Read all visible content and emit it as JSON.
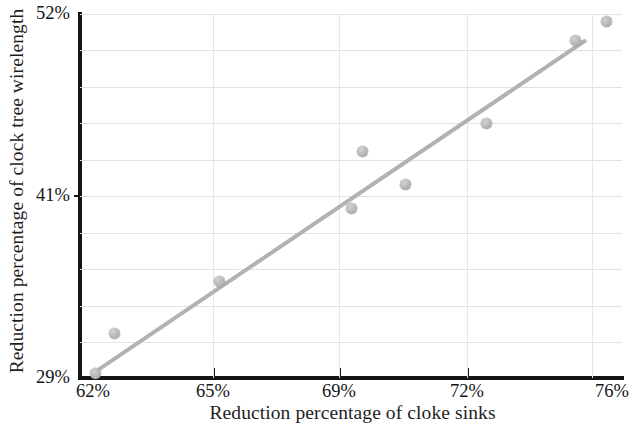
{
  "chart_data": {
    "type": "scatter",
    "title": "",
    "xlabel": "Reduction percentage of cloke sinks",
    "ylabel": "Reduction percentage of clock tree wirelength",
    "xlim": [
      62,
      76
    ],
    "ylim": [
      29,
      52
    ],
    "xtick_labels": [
      "62%",
      "65%",
      "69%",
      "72%",
      "76%"
    ],
    "xtick_values": [
      62,
      65,
      69,
      72,
      76
    ],
    "ytick_labels": [
      "29%",
      "41%",
      "52%"
    ],
    "ytick_values": [
      29,
      41,
      52
    ],
    "grid": true,
    "legend": "none",
    "marker_color": "#b6b6b6",
    "trendline_color": "#b2b2b2",
    "axis_color": "#141414",
    "points": [
      {
        "x": 62.4,
        "y": 29.3
      },
      {
        "x": 62.9,
        "y": 31.8
      },
      {
        "x": 65.6,
        "y": 35.1
      },
      {
        "x": 69.3,
        "y": 43.3
      },
      {
        "x": 69.0,
        "y": 39.7
      },
      {
        "x": 70.4,
        "y": 41.2
      },
      {
        "x": 72.5,
        "y": 45.1
      },
      {
        "x": 74.8,
        "y": 50.3
      },
      {
        "x": 75.6,
        "y": 51.5
      }
    ],
    "trendline": {
      "x0": 62.4,
      "y0": 29.4,
      "x1": 75.1,
      "y1": 50.4
    }
  }
}
